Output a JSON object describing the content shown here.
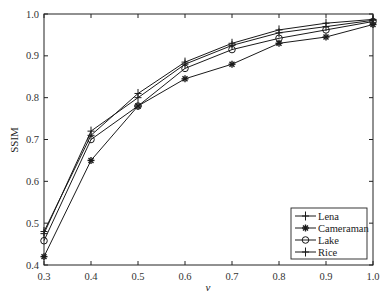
{
  "chart_data": {
    "type": "line",
    "title": "",
    "xlabel": "v",
    "ylabel": "SSIM",
    "xlim": [
      0.3,
      1.0
    ],
    "ylim": [
      0.4,
      1.0
    ],
    "grid": false,
    "legend_position": "lower right",
    "x": [
      0.3,
      0.4,
      0.5,
      0.6,
      0.7,
      0.8,
      0.9,
      1.0
    ],
    "x_ticks": [
      "0.3",
      "0.4",
      "0.5",
      "0.6",
      "0.7",
      "0.8",
      "0.9",
      "1.0"
    ],
    "y_ticks": [
      "0.4",
      "0.5",
      "0.6",
      "0.7",
      "0.8",
      "0.9",
      "1.0"
    ],
    "series": [
      {
        "name": "Lena",
        "marker": "plus",
        "values": [
          0.475,
          0.72,
          0.8,
          0.88,
          0.925,
          0.955,
          0.97,
          0.985
        ]
      },
      {
        "name": "Cameraman",
        "marker": "star",
        "values": [
          0.42,
          0.65,
          0.78,
          0.845,
          0.88,
          0.93,
          0.945,
          0.975
        ]
      },
      {
        "name": "Lake",
        "marker": "circle",
        "values": [
          0.458,
          0.7,
          0.78,
          0.87,
          0.915,
          0.942,
          0.962,
          0.982
        ]
      },
      {
        "name": "Rice",
        "marker": "plus",
        "values": [
          0.48,
          0.71,
          0.81,
          0.885,
          0.93,
          0.962,
          0.978,
          0.987
        ]
      }
    ]
  },
  "colors": {
    "line": "#1a1a1a",
    "axis": "#222222",
    "background": "#ffffff"
  }
}
